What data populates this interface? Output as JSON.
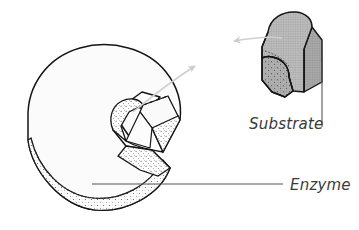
{
  "figure": {
    "background_color": "#ffffff",
    "line_color": "#1a1a1a",
    "arrow_color": "#c9c9c9",
    "leader_color": "#555555",
    "stipple_color": "#4a4a4a",
    "substrate_fill": "#b8b8b8",
    "enzyme_fill": "#fbfbfb"
  },
  "labels": {
    "substrate": "Substrate",
    "enzyme": "Enzyme"
  },
  "shapes": {
    "enzyme_name": "enzyme-body",
    "substrate_name": "substrate-block",
    "active_site_name": "active-site-notch"
  },
  "annotations": {
    "arrow_to_enzyme": "arrow pointing from substrate toward enzyme active site",
    "arrow_from_site": "arrow pointing from enzyme active site up toward substrate",
    "substrate_leader": "vertical leader line from substrate to Substrate label",
    "enzyme_leader": "horizontal leader line from enzyme body to Enzyme label"
  }
}
